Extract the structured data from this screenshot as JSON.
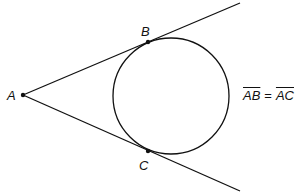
{
  "diagram": {
    "type": "geometry-tangent-lines",
    "stroke_color": "#111111",
    "points": {
      "A": {
        "label": "A",
        "x": 23,
        "y": 95
      },
      "B": {
        "label": "B",
        "x": 148,
        "y": 42
      },
      "C": {
        "label": "C",
        "x": 148,
        "y": 151
      }
    },
    "circle": {
      "cx": 171,
      "cy": 96,
      "r": 58
    },
    "lines": [
      {
        "from": "A",
        "through": "B",
        "end_x": 240,
        "end_y": 3
      },
      {
        "from": "A",
        "through": "C",
        "end_x": 240,
        "end_y": 191
      }
    ],
    "equation": {
      "left": "AB",
      "operator": "=",
      "right": "AC"
    }
  }
}
